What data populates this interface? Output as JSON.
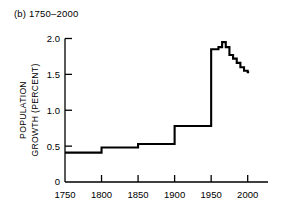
{
  "figure": {
    "panel_label": "(b) 1750–2000"
  },
  "chart_data": {
    "type": "line",
    "step": "post",
    "title": "(b) 1750–2000",
    "xlabel": "",
    "ylabel": "POPULATION GROWTH (PERCENT)",
    "ylabel_lines": [
      "POPULATION",
      "GROWTH (PERCENT)"
    ],
    "xlim": [
      1750,
      2010
    ],
    "ylim": [
      0,
      2.05
    ],
    "xticks": [
      1750,
      1800,
      1850,
      1900,
      1950,
      2000
    ],
    "xtick_labels": [
      "1750",
      "1800",
      "1850",
      "1900",
      "1950",
      "2000"
    ],
    "yticks": [
      0,
      0.5,
      1.0,
      1.5,
      2.0
    ],
    "ytick_labels": [
      "0",
      "0.5",
      "1.0",
      "1.5",
      "2.0"
    ],
    "grid": false,
    "legend": null,
    "line_color": "#000000",
    "line_width": 2.1,
    "series": [
      {
        "name": "World population growth rate",
        "x": [
          1750,
          1800,
          1850,
          1900,
          1950,
          1955,
          1960,
          1965,
          1970,
          1975,
          1980,
          1985,
          1990,
          1995,
          2000
        ],
        "values": [
          0.41,
          0.48,
          0.53,
          0.78,
          1.85,
          1.85,
          1.88,
          1.95,
          1.88,
          1.77,
          1.72,
          1.66,
          1.6,
          1.55,
          1.53
        ]
      }
    ]
  }
}
